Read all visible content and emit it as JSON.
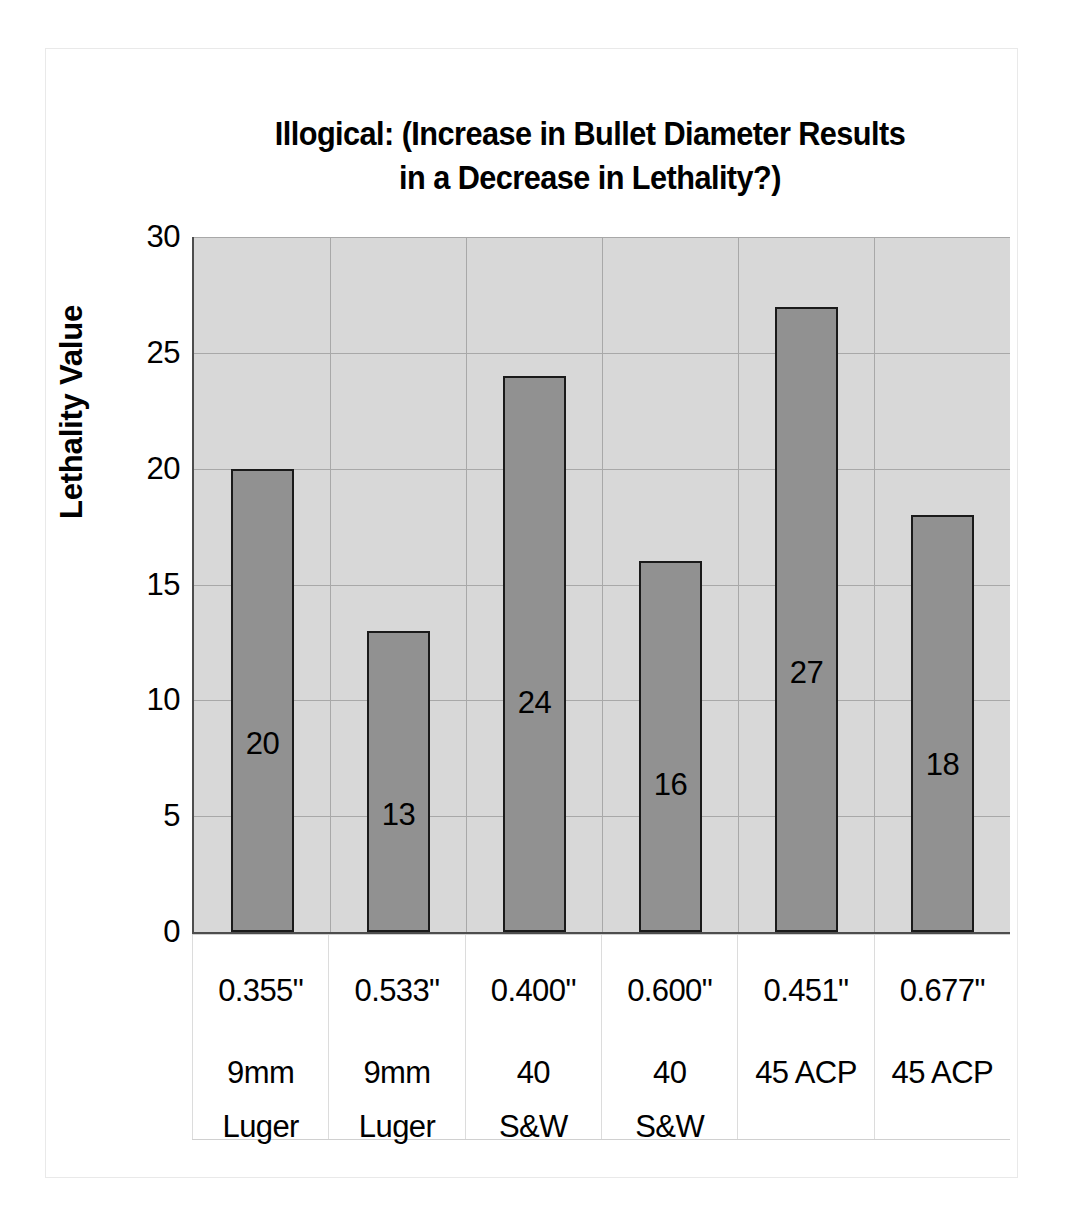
{
  "chart_data": {
    "type": "bar",
    "title": "Illogical: (Increase in Bullet Diameter Results\nin a Decrease in Lethality?)",
    "xlabel": "",
    "ylabel": "Lethality Value",
    "ylim": [
      0,
      30
    ],
    "ytick_step": 5,
    "yticks": [
      "30",
      "25",
      "20",
      "15",
      "10",
      "5",
      "0"
    ],
    "grid": true,
    "legend": false,
    "categories": [
      {
        "diameter": "0.355\"",
        "cartridge_line1": "9mm",
        "cartridge_line2": "Luger"
      },
      {
        "diameter": "0.533\"",
        "cartridge_line1": "9mm",
        "cartridge_line2": "Luger"
      },
      {
        "diameter": "0.400\"",
        "cartridge_line1": "40",
        "cartridge_line2": "S&W"
      },
      {
        "diameter": "0.600\"",
        "cartridge_line1": "40",
        "cartridge_line2": "S&W"
      },
      {
        "diameter": "0.451\"",
        "cartridge_line1": "45 ACP",
        "cartridge_line2": ""
      },
      {
        "diameter": "0.677\"",
        "cartridge_line1": "45 ACP",
        "cartridge_line2": ""
      }
    ],
    "values": [
      20,
      13,
      24,
      16,
      27,
      18
    ],
    "data_labels": [
      "20",
      "13",
      "24",
      "16",
      "27",
      "18"
    ],
    "colors": {
      "bar_fill": "#919191",
      "bar_border": "#1a1a1a",
      "plot_background": "#d8d8d8",
      "gridline": "#a8a8a8",
      "axis": "#4d4d4d",
      "text": "#000000",
      "figure_background": "#ffffff"
    }
  }
}
